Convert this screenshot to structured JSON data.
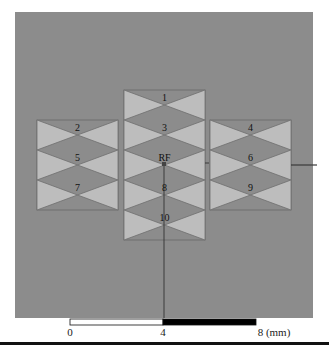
{
  "figure": {
    "background_color": "#8c8c8c",
    "element_fill": "#bdbdbd",
    "element_stroke": "#6e6e6e",
    "panel": {
      "x": 15,
      "y": 12,
      "width": 298,
      "height": 306
    },
    "columns": [
      {
        "name": "left",
        "x": 37,
        "width": 81,
        "top": 120,
        "rows": 3,
        "row_height": 30
      },
      {
        "name": "center",
        "x": 124,
        "width": 81,
        "top": 90,
        "rows": 5,
        "row_height": 30
      },
      {
        "name": "right",
        "x": 210,
        "width": 81,
        "top": 120,
        "rows": 3,
        "row_height": 30
      }
    ],
    "elements": [
      {
        "label": "1",
        "column": "center",
        "row": 0
      },
      {
        "label": "2",
        "column": "left",
        "row": 0
      },
      {
        "label": "3",
        "column": "center",
        "row": 1
      },
      {
        "label": "4",
        "column": "right",
        "row": 0
      },
      {
        "label": "5",
        "column": "left",
        "row": 1
      },
      {
        "label": "RF",
        "column": "center",
        "row": 2
      },
      {
        "label": "6",
        "column": "right",
        "row": 1
      },
      {
        "label": "7",
        "column": "left",
        "row": 2
      },
      {
        "label": "8",
        "column": "center",
        "row": 3
      },
      {
        "label": "9",
        "column": "right",
        "row": 2
      },
      {
        "label": "10",
        "column": "center",
        "row": 4
      }
    ],
    "feed_line_vertical": {
      "x": 164,
      "y1": 164,
      "y2": 318
    },
    "feed_line_horizontal": {
      "x1": 291,
      "x2": 317,
      "y": 165
    },
    "rf_port": {
      "x": 164,
      "y": 164
    }
  },
  "scale_bar": {
    "unit": "(mm)",
    "ticks": [
      {
        "label": "0",
        "x": 70
      },
      {
        "label": "4",
        "x": 163
      },
      {
        "label": "8 (mm)",
        "x": 256
      }
    ],
    "segments": [
      {
        "x1": 70,
        "x2": 163,
        "color": "#ffffff"
      },
      {
        "x1": 163,
        "x2": 256,
        "color": "#000000"
      }
    ]
  }
}
